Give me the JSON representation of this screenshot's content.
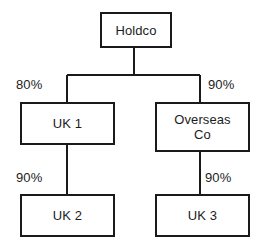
{
  "diagram": {
    "type": "organisation-ownership-chart",
    "orientation": "top-down",
    "stroke_color": "#1a1a1a",
    "text_color": "#1c1c1c",
    "background_color": "#ffffff",
    "nodes": [
      {
        "id": "holdco",
        "label": "Holdco"
      },
      {
        "id": "uk1",
        "label": "UK 1"
      },
      {
        "id": "overseas_co",
        "label": "Overseas\nCo"
      },
      {
        "id": "uk2",
        "label": "UK 2"
      },
      {
        "id": "uk3",
        "label": "UK 3"
      }
    ],
    "edges": [
      {
        "from": "holdco",
        "to": "uk1",
        "label": "80%"
      },
      {
        "from": "holdco",
        "to": "overseas_co",
        "label": "90%"
      },
      {
        "from": "uk1",
        "to": "uk2",
        "label": "90%"
      },
      {
        "from": "overseas_co",
        "to": "uk3",
        "label": "90%"
      }
    ]
  }
}
